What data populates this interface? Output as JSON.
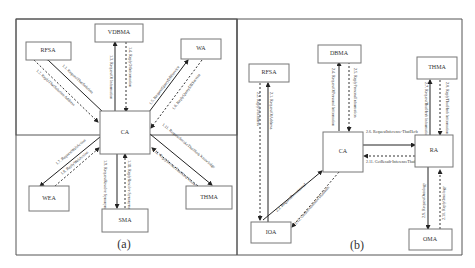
{
  "panel_a": {
    "caption": "(a)",
    "nodes": {
      "ca": "CA",
      "vdbma": "VDBMA",
      "rfsa": "RFSA",
      "wa": "WA",
      "wea": "WEA",
      "sma": "SMA",
      "thma": "THMA"
    },
    "edges": {
      "e1_1": "1.1. RequestThatSolution",
      "e1_2": "1.2. ReplyThatSolution Address",
      "e1_3": "1.3. RequestOf Information",
      "e1_4": "1.4. ReplyOfInformation",
      "e1_5": "1.5. RequestQueryDBService",
      "e1_6": "1.6. ReplyQueryDBService",
      "e1_7": "1.7. RequestWebAction",
      "e1_8": "1.8. ReplyWebAction",
      "e1_9": "1.9. RequestResolve Synonyms",
      "e1_10": "1.10. ReplyResolve Synonyms",
      "e1_11": "1.11. RequestInvokeThatHerb Knowledge",
      "e1_12": "1.12. ReplyInvokeThatHerb Knowledge"
    }
  },
  "panel_b": {
    "caption": "(b)",
    "nodes": {
      "ca": "CA",
      "dbma": "DBMA",
      "rfsa": "RFSA",
      "thma": "THMA",
      "ra": "RA",
      "ioa": "IOA",
      "oma": "OMA"
    },
    "edges": {
      "e2_1": "2.1. RequestOfAddress",
      "e2_2": "2.2. ReplyOfAddress",
      "e2_3": "2.3. RequestRecommend",
      "e2_4": "2.4. RequestOfPersonal Information",
      "e2_5": "2.5. ReplyPersonalInformation",
      "e2_6": "2.6. RequestInference-ThatHerb",
      "e2_7": "2.7. RequestThatHerb Information",
      "e2_8": "2.8. ReplyThatHerb Information",
      "e2_9": "2.9. RequestOntology",
      "e2_10": "2.10. ReplyOntology",
      "e2_11": "2.11. GetResult-InferenceThatHerb",
      "e2_12": "2.12. GetRecommendThatHerb"
    }
  }
}
